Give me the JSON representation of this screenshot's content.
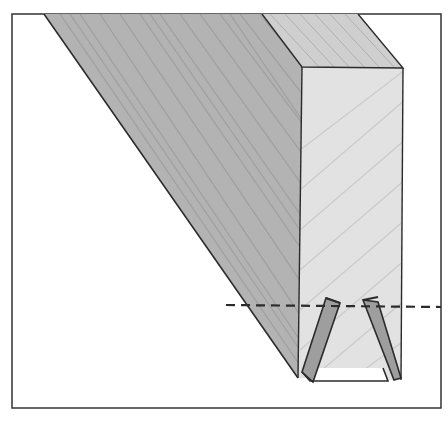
{
  "figure": {
    "frame": {
      "x": 12,
      "y": 14,
      "w": 429,
      "h": 394,
      "stroke": "#333333"
    },
    "colors": {
      "background": "#ffffff",
      "side_face": "#b3b3b3",
      "top_face": "#cfcfcf",
      "end_face": "#e2e2e2",
      "kerf_fill": "#9e9e9e",
      "outline": "#2b2b2b",
      "grain": "#8f8f8f"
    },
    "cut_line": {
      "y": 306,
      "x1": 226,
      "x2": 441,
      "style": "dashed"
    }
  }
}
